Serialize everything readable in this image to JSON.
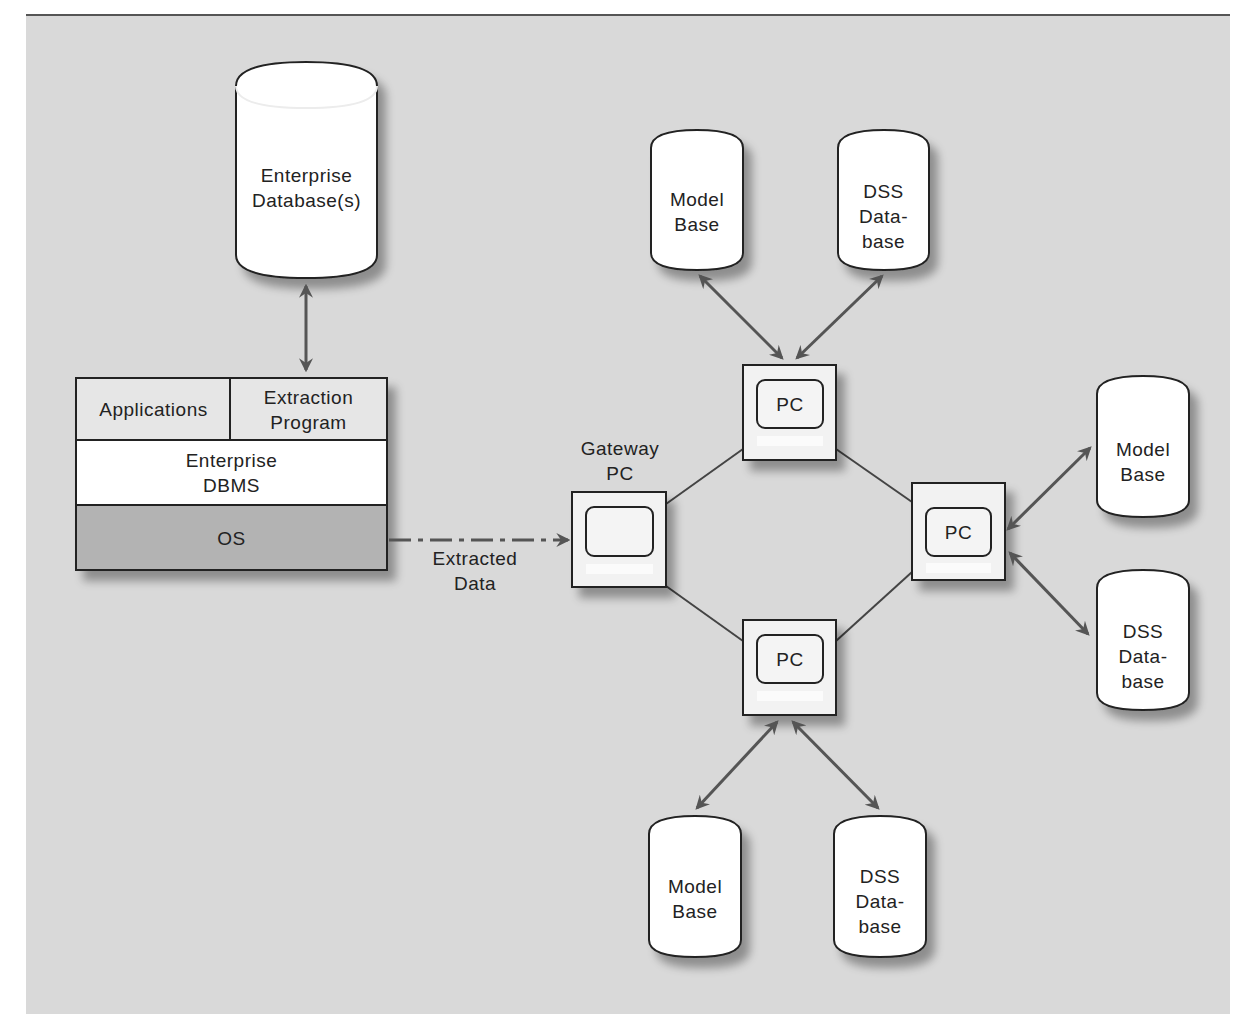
{
  "diagram": {
    "enterprise_db": {
      "label": "Enterprise\nDatabase(s)"
    },
    "host_stack": {
      "applications": "Applications",
      "extraction_program": "Extraction\nProgram",
      "enterprise_dbms": "Enterprise\nDBMS",
      "os": "OS"
    },
    "extracted_data": {
      "label": "Extracted\nData"
    },
    "gateway_pc": {
      "label": "Gateway\nPC"
    },
    "pcs": [
      {
        "id": "top",
        "label": "PC"
      },
      {
        "id": "right",
        "label": "PC"
      },
      {
        "id": "bottom",
        "label": "PC"
      }
    ],
    "databases": [
      {
        "group": "top",
        "label": "Model\nBase"
      },
      {
        "group": "top",
        "label": "DSS\nData-\nbase"
      },
      {
        "group": "right",
        "label": "Model\nBase"
      },
      {
        "group": "right",
        "label": "DSS\nData-\nbase"
      },
      {
        "group": "bottom",
        "label": "Model\nBase"
      },
      {
        "group": "bottom",
        "label": "DSS\nData-\nbase"
      }
    ],
    "colors": {
      "background": "#d9d9d9",
      "cylinder_fill": "#ffffff",
      "stack_top_row": "#e6e6e6",
      "stack_dbms": "#ffffff",
      "stack_os": "#b3b3b3",
      "arrow": "#555555",
      "line": "#444444"
    }
  }
}
